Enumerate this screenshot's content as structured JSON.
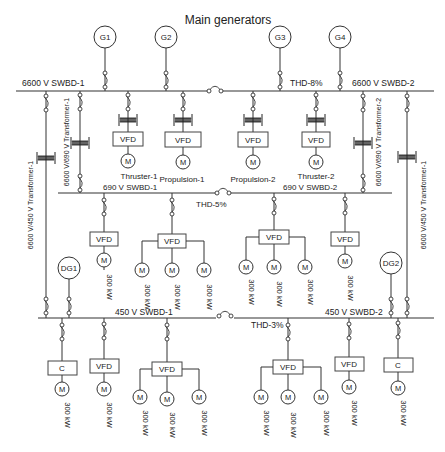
{
  "title": "Main generators",
  "colors": {
    "line": "#333333",
    "text": "#222222",
    "background": "#ffffff"
  },
  "buses": {
    "hv1": {
      "label": "6600 V SWBD-1"
    },
    "hv2": {
      "label": "6600 V SWBD-2"
    },
    "hv_thd": "THD-8%",
    "mv1": {
      "label": "690 V SWBD-1"
    },
    "mv2": {
      "label": "690 V SWBD-2"
    },
    "mv_thd": "THD-5%",
    "lv1": {
      "label": "450 V SWBD-1"
    },
    "lv2": {
      "label": "450 V SWBD-2"
    },
    "lv_thd": "THD-3%"
  },
  "generators": [
    {
      "id": "G1",
      "label": "G1"
    },
    {
      "id": "G2",
      "label": "G2"
    },
    {
      "id": "G3",
      "label": "G3"
    },
    {
      "id": "G4",
      "label": "G4"
    }
  ],
  "diesel_generators": [
    {
      "id": "DG1",
      "label": "DG1"
    },
    {
      "id": "DG2",
      "label": "DG2"
    }
  ],
  "transformers": [
    {
      "label": "6600 V/450 V Transformer-1"
    },
    {
      "label": "6600 V/690 V Transformer-1"
    },
    {
      "label": "6600 V/690 V Transformer-2"
    },
    {
      "label": "6600 V/450 V Transformer-1"
    }
  ],
  "hv_drives": [
    {
      "vfd": "VFD",
      "motor": "M",
      "name": "Thruster-1"
    },
    {
      "vfd": "VFD",
      "motor": "M",
      "name": "Propulsion-1"
    },
    {
      "vfd": "VFD",
      "motor": "M",
      "name": "Propulsion-2"
    },
    {
      "vfd": "VFD",
      "motor": "M",
      "name": "Thruster-2"
    }
  ],
  "converter_labels": {
    "vfd": "VFD",
    "converter": "C",
    "motor": "M"
  },
  "motor_rating": "300 kW"
}
